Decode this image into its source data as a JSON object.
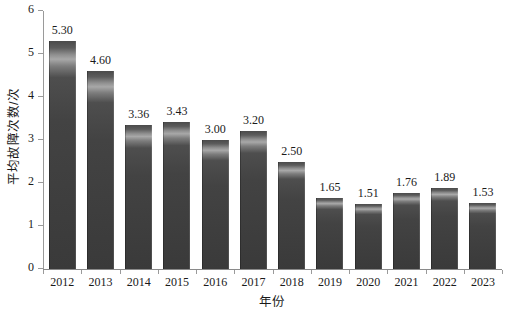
{
  "chart_data": {
    "type": "bar",
    "title": "",
    "xlabel": "年份",
    "ylabel": "平均故障次数/次",
    "categories": [
      "2012",
      "2013",
      "2014",
      "2015",
      "2016",
      "2017",
      "2018",
      "2019",
      "2020",
      "2021",
      "2022",
      "2023"
    ],
    "values": [
      5.3,
      4.6,
      3.36,
      3.43,
      3.0,
      3.2,
      2.5,
      1.65,
      1.51,
      1.76,
      1.89,
      1.53
    ],
    "value_labels": [
      "5.30",
      "4.60",
      "3.36",
      "3.43",
      "3.00",
      "3.20",
      "2.50",
      "1.65",
      "1.51",
      "1.76",
      "1.89",
      "1.53"
    ],
    "ylim": [
      0,
      6
    ],
    "yticks": [
      0,
      1,
      2,
      3,
      4,
      5,
      6
    ],
    "ytick_labels": [
      "0",
      "1",
      "2",
      "3",
      "4",
      "5",
      "6"
    ],
    "grid": false,
    "legend": null,
    "series": [
      {
        "name": "平均故障次数",
        "values": [
          5.3,
          4.6,
          3.36,
          3.43,
          3.0,
          3.2,
          2.5,
          1.65,
          1.51,
          1.76,
          1.89,
          1.53
        ],
        "color": "#434343"
      }
    ]
  },
  "style": {
    "bar_color": "#434343",
    "bar_highlight_color": "#a8a8a8",
    "axis_color": "#9a9a9a",
    "text_color": "#1a1a1a",
    "background": "#ffffff"
  }
}
